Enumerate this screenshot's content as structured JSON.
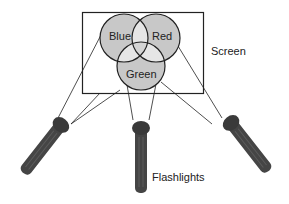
{
  "diagram": {
    "labels": {
      "blue": "Blue",
      "red": "Red",
      "green": "Green",
      "screen": "Screen",
      "flashlights": "Flashlights"
    },
    "colors": {
      "circle_fill": "#c8c8c8",
      "pair_overlap_fill": "#e6e6e6",
      "center_overlap_fill": "#d0d0d0",
      "flashlight_body": "#454545",
      "flashlight_head": "#3a3a3a",
      "line": "#222222"
    }
  }
}
